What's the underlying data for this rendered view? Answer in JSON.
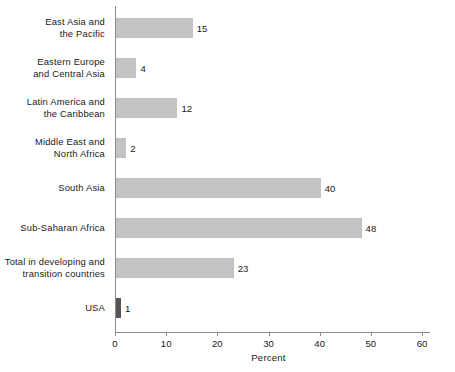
{
  "chart_data": {
    "type": "bar",
    "orientation": "horizontal",
    "title": "",
    "xlabel": "Percent",
    "ylabel": "",
    "xlim": [
      0,
      60
    ],
    "xticks": [
      0,
      10,
      20,
      30,
      40,
      50,
      60
    ],
    "grid": false,
    "legend": null,
    "categories": [
      "East Asia and\nthe Pacific",
      "Eastern Europe\nand Central Asia",
      "Latin America and\nthe Caribbean",
      "Middle East and\nNorth Africa",
      "South Asia",
      "Sub-Saharan Africa",
      "Total in developing and\ntransition countries",
      "USA"
    ],
    "values": [
      15,
      4,
      12,
      2,
      40,
      48,
      23,
      1
    ],
    "bars": [
      {
        "label_line1": "East Asia and",
        "label_line2": "the Pacific",
        "value": 15,
        "value_text": "15",
        "color": "#c3c3c3"
      },
      {
        "label_line1": "Eastern Europe",
        "label_line2": "and Central Asia",
        "value": 4,
        "value_text": "4",
        "color": "#c3c3c3"
      },
      {
        "label_line1": "Latin America and",
        "label_line2": "the Caribbean",
        "value": 12,
        "value_text": "12",
        "color": "#c3c3c3"
      },
      {
        "label_line1": "Middle East and",
        "label_line2": "North Africa",
        "value": 2,
        "value_text": "2",
        "color": "#c3c3c3"
      },
      {
        "label_line1": "South Asia",
        "label_line2": "",
        "value": 40,
        "value_text": "40",
        "color": "#c3c3c3"
      },
      {
        "label_line1": "Sub-Saharan Africa",
        "label_line2": "",
        "value": 48,
        "value_text": "48",
        "color": "#c3c3c3"
      },
      {
        "label_line1": "Total in developing and",
        "label_line2": "transition countries",
        "value": 23,
        "value_text": "23",
        "color": "#c3c3c3"
      },
      {
        "label_line1": "USA",
        "label_line2": "",
        "value": 1,
        "value_text": "1",
        "color": "#555555"
      }
    ],
    "tick_labels": [
      "0",
      "10",
      "20",
      "30",
      "40",
      "50",
      "60"
    ],
    "colors": {
      "bar_fill": "#c3c3c3",
      "bar_fill_highlight": "#555555",
      "axis": "#8c8c8c",
      "text": "#1a1a1a",
      "background": "#ffffff"
    }
  }
}
